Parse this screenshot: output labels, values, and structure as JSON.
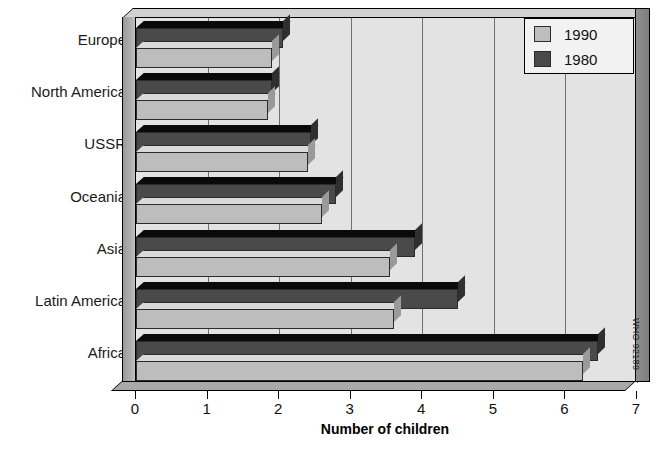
{
  "chart_data": {
    "type": "bar",
    "orientation": "horizontal",
    "title": "",
    "xlabel": "Number of children",
    "ylabel": "",
    "xlim": [
      0,
      7
    ],
    "xticks": [
      "0",
      "1",
      "2",
      "3",
      "4",
      "5",
      "6",
      "7"
    ],
    "grid": true,
    "legend_position": "top-right",
    "categories": [
      "Europe",
      "North America",
      "USSR",
      "Oceania",
      "Asia",
      "Latin America",
      "Africa"
    ],
    "series": [
      {
        "name": "1990",
        "color": "#bdbdbd",
        "values": [
          1.9,
          1.85,
          2.4,
          2.6,
          3.55,
          3.6,
          6.25
        ]
      },
      {
        "name": "1980",
        "color": "#4a4a4a",
        "values": [
          2.05,
          1.9,
          2.45,
          2.8,
          3.9,
          4.5,
          6.45
        ]
      }
    ]
  },
  "legend": {
    "entries": [
      {
        "label": "1990",
        "swatch": "light"
      },
      {
        "label": "1980",
        "swatch": "dark"
      }
    ]
  },
  "axis": {
    "x_title": "Number of children",
    "ticks": [
      "0",
      "1",
      "2",
      "3",
      "4",
      "5",
      "6",
      "7"
    ]
  },
  "credit": {
    "text": "WHO 92189"
  },
  "colors": {
    "series_1990": "#bdbdbd",
    "series_1980": "#4a4a4a",
    "plot_background": "#e3e3e3",
    "gridline": "#6f6f6f",
    "text": "#111111"
  }
}
